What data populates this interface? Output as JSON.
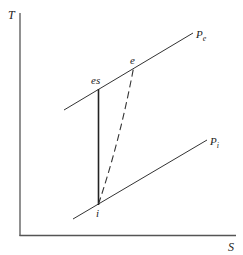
{
  "diagram": {
    "type": "T-S diagram",
    "axes": {
      "y_label": "T",
      "x_label": "S"
    },
    "isobars": [
      {
        "name": "exit-pressure",
        "label_main": "P",
        "label_sub": "e"
      },
      {
        "name": "inlet-pressure",
        "label_main": "P",
        "label_sub": "i"
      }
    ],
    "points": [
      {
        "id": "es",
        "label": "es"
      },
      {
        "id": "e",
        "label": "e"
      },
      {
        "id": "i",
        "label": "i"
      }
    ],
    "processes": [
      {
        "from": "i",
        "to": "es",
        "style": "solid",
        "description": "isentropic compression"
      },
      {
        "from": "i",
        "to": "e",
        "style": "dashed",
        "description": "actual compression"
      }
    ],
    "colors": {
      "line": "#333333",
      "background": "#ffffff"
    }
  }
}
